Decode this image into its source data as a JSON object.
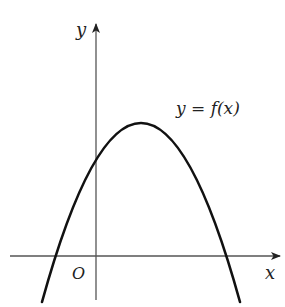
{
  "diagram": {
    "type": "function-graph",
    "axes": {
      "x_label": "x",
      "y_label": "y",
      "origin_label": "O"
    },
    "curve": {
      "label": "y = f(x)",
      "shape": "parabola-opening-down",
      "vertex_position": "first quadrant",
      "y_intercept": "positive",
      "roots": [
        "negative",
        "positive"
      ]
    },
    "colors": {
      "axis": "#555555",
      "curve": "#111111",
      "text": "#222222"
    }
  }
}
